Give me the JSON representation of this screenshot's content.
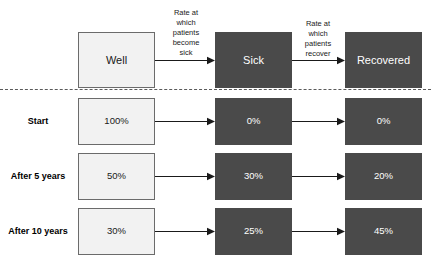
{
  "diagram": {
    "columns": [
      {
        "key": "well",
        "label": "Well",
        "style": "light"
      },
      {
        "key": "sick",
        "label": "Sick",
        "style": "dark"
      },
      {
        "key": "recovered",
        "label": "Recovered",
        "style": "dark"
      }
    ],
    "annotations": [
      {
        "key": "become-sick",
        "text": "Rate at\nwhich\npatients\nbecome\nsick"
      },
      {
        "key": "recover",
        "text": "Rate at\nwhich\npatients\nrecover"
      }
    ],
    "rows": [
      {
        "key": "start",
        "label": "Start",
        "well": "100%",
        "sick": "0%",
        "recovered": "0%"
      },
      {
        "key": "after-5-years",
        "label": "After 5\nyears",
        "well": "50%",
        "sick": "30%",
        "recovered": "20%"
      },
      {
        "key": "after-10-years",
        "label": "After 10\nyears",
        "well": "30%",
        "sick": "25%",
        "recovered": "45%"
      }
    ],
    "colors": {
      "light_box_fill": "#f2f2f2",
      "light_box_border": "#6b6b6b",
      "dark_box_fill": "#4a4a4a",
      "dark_box_text": "#ffffff",
      "text": "#1a1a1a",
      "divider": "#5a5a5a",
      "arrow": "#1a1a1a",
      "background": "#ffffff"
    }
  }
}
